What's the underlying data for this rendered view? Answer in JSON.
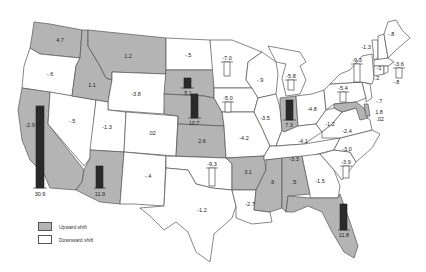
{
  "map": {
    "type": "choropleth-with-bars",
    "region": "United States (contiguous)",
    "colors": {
      "upward": "#b4b4b4",
      "downward": "#ffffff",
      "border": "#555555",
      "bar_up": "#2a2a2a",
      "bar_down": "#ffffff"
    },
    "legend": [
      {
        "label": "Upward shift",
        "color": "#b4b4b4"
      },
      {
        "label": "Downward shift",
        "color": "#ffffff"
      }
    ],
    "states": [
      {
        "state": "WA",
        "value": "4.7",
        "shift": "up"
      },
      {
        "state": "OR",
        "value": "-.6",
        "shift": "down"
      },
      {
        "state": "CA",
        "value": "30.9",
        "shift": "up",
        "bar": true
      },
      {
        "state": "CA-inset",
        "value": "-2.9",
        "shift": "up"
      },
      {
        "state": "ID",
        "value": "1.1",
        "shift": "up"
      },
      {
        "state": "NV",
        "value": "-.5",
        "shift": "down"
      },
      {
        "state": "MT",
        "value": "1.2",
        "shift": "up"
      },
      {
        "state": "WY",
        "value": "-3.8",
        "shift": "down"
      },
      {
        "state": "UT",
        "value": "-1.3",
        "shift": "down"
      },
      {
        "state": "AZ",
        "value": "11.9",
        "shift": "up",
        "bar": true
      },
      {
        "state": "CO",
        "value": ".02",
        "shift": "down"
      },
      {
        "state": "NM",
        "value": "-.4",
        "shift": "down"
      },
      {
        "state": "ND",
        "value": "-.5",
        "shift": "down"
      },
      {
        "state": "SD",
        "value": "5.1",
        "shift": "up",
        "bar": true
      },
      {
        "state": "NE",
        "value": "10.7",
        "shift": "up",
        "bar": true
      },
      {
        "state": "KS",
        "value": "2.6",
        "shift": "up"
      },
      {
        "state": "OK",
        "value": "-9.3",
        "shift": "down",
        "bar": true
      },
      {
        "state": "TX",
        "value": "-1.2",
        "shift": "down"
      },
      {
        "state": "MN",
        "value": "-7.0",
        "shift": "down",
        "bar": true
      },
      {
        "state": "IA",
        "value": "-5.0",
        "shift": "down",
        "bar": true
      },
      {
        "state": "MO",
        "value": "-4.2",
        "shift": "down"
      },
      {
        "state": "AR",
        "value": "3.1",
        "shift": "up"
      },
      {
        "state": "LA",
        "value": "-2.7",
        "shift": "down"
      },
      {
        "state": "WI",
        "value": "-.9",
        "shift": "down"
      },
      {
        "state": "IL",
        "value": "-3.5",
        "shift": "down"
      },
      {
        "state": "MI",
        "value": "-5.8",
        "shift": "down",
        "bar": true
      },
      {
        "state": "IN",
        "value": "7.3",
        "shift": "up",
        "bar": true
      },
      {
        "state": "OH",
        "value": "-4.8",
        "shift": "down"
      },
      {
        "state": "KY",
        "value": "-4.1",
        "shift": "down"
      },
      {
        "state": "TN",
        "value": "-3.3",
        "shift": "down"
      },
      {
        "state": "MS",
        "value": ".6",
        "shift": "up"
      },
      {
        "state": "AL",
        "value": ".5",
        "shift": "up"
      },
      {
        "state": "GA",
        "value": "-1.5",
        "shift": "down"
      },
      {
        "state": "FL",
        "value": "11.8",
        "shift": "up",
        "bar": true
      },
      {
        "state": "SC",
        "value": "-3.9",
        "shift": "down",
        "bar": true
      },
      {
        "state": "NC",
        "value": "-3.0",
        "shift": "down"
      },
      {
        "state": "VA",
        "value": "-2.4",
        "shift": "down"
      },
      {
        "state": "WV",
        "value": "-1.2",
        "shift": "down"
      },
      {
        "state": "PA",
        "value": "-5.4",
        "shift": "down",
        "bar": true
      },
      {
        "state": "NY",
        "value": "-9.3",
        "shift": "down",
        "bar": true
      },
      {
        "state": "MD",
        "value": "1.8",
        "shift": "up"
      },
      {
        "state": "DE",
        "value": ".02",
        "shift": "up"
      },
      {
        "state": "NJ",
        "value": "-.7",
        "shift": "down"
      },
      {
        "state": "VT",
        "value": "-1.3",
        "shift": "down"
      },
      {
        "state": "NH",
        "value": "-1",
        "shift": "down"
      },
      {
        "state": "ME",
        "value": "-.8",
        "shift": "down"
      },
      {
        "state": "MA",
        "value": "-3.6",
        "shift": "down",
        "bar": true
      },
      {
        "state": "CT",
        "value": "-.2",
        "shift": "down"
      },
      {
        "state": "RI",
        "value": "-.8",
        "shift": "down"
      }
    ]
  }
}
